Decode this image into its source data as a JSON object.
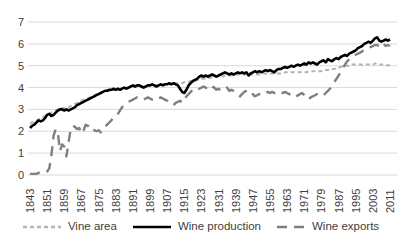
{
  "chart_data": {
    "type": "line",
    "title": "",
    "xlabel": "",
    "ylabel": "",
    "grid": "horizontal",
    "legend_position": "bottom",
    "x_axis": {
      "start_year": 1843,
      "end_year": 2011,
      "step": 1,
      "tick_labels": [
        "1843",
        "1851",
        "1859",
        "1867",
        "1875",
        "1883",
        "1891",
        "1899",
        "1907",
        "1915",
        "1923",
        "1931",
        "1939",
        "1947",
        "1955",
        "1963",
        "1971",
        "1979",
        "1987",
        "1995",
        "2003",
        "2011"
      ]
    },
    "y_axis": {
      "min": 0,
      "max": 7,
      "tick_step": 1,
      "tick_labels": [
        "0",
        "1",
        "2",
        "3",
        "4",
        "5",
        "6",
        "7"
      ]
    },
    "colors": {
      "gridline": "#d9d9d9",
      "tick_text": "#404040"
    },
    "series": [
      {
        "name": "Vine area",
        "color": "#b3b3b3",
        "dash": "4 3",
        "width": 2,
        "values": [
          2.35,
          2.4,
          2.45,
          2.5,
          2.55,
          2.6,
          2.65,
          2.7,
          2.75,
          2.8,
          2.85,
          2.9,
          2.95,
          3.0,
          3.0,
          3.05,
          3.05,
          3.1,
          3.1,
          3.15,
          3.2,
          3.25,
          3.3,
          3.35,
          3.4,
          3.45,
          3.5,
          3.5,
          3.55,
          3.6,
          3.65,
          3.7,
          3.7,
          3.75,
          3.8,
          3.8,
          3.85,
          3.85,
          3.9,
          3.9,
          3.9,
          3.95,
          3.95,
          3.95,
          4.0,
          4.0,
          4.0,
          4.05,
          4.05,
          4.05,
          4.05,
          4.05,
          4.05,
          4.05,
          4.1,
          4.1,
          4.1,
          4.1,
          4.1,
          4.1,
          4.1,
          4.15,
          4.15,
          4.15,
          4.15,
          4.15,
          4.15,
          4.2,
          4.2,
          4.2,
          4.2,
          4.2,
          4.25,
          4.25,
          4.25,
          4.3,
          4.3,
          4.3,
          4.35,
          4.35,
          4.4,
          4.4,
          4.4,
          4.45,
          4.45,
          4.45,
          4.5,
          4.5,
          4.5,
          4.5,
          4.5,
          4.55,
          4.55,
          4.55,
          4.55,
          4.55,
          4.6,
          4.6,
          4.6,
          4.6,
          4.6,
          4.6,
          4.6,
          4.6,
          4.6,
          4.6,
          4.6,
          4.6,
          4.6,
          4.65,
          4.65,
          4.65,
          4.65,
          4.65,
          4.65,
          4.65,
          4.65,
          4.65,
          4.65,
          4.7,
          4.7,
          4.7,
          4.7,
          4.7,
          4.7,
          4.7,
          4.7,
          4.7,
          4.7,
          4.7,
          4.75,
          4.75,
          4.75,
          4.75,
          4.75,
          4.75,
          4.75,
          4.8,
          4.8,
          4.8,
          4.85,
          4.85,
          4.85,
          4.9,
          4.9,
          4.95,
          4.95,
          5.0,
          5.0,
          5.0,
          5.05,
          5.05,
          5.05,
          5.05,
          5.05,
          5.05,
          5.05,
          5.05,
          5.05,
          5.05,
          5.05,
          5.1,
          5.1,
          5.05,
          5.05,
          5.05,
          5.05,
          5.0,
          5.05
        ]
      },
      {
        "name": "Wine production",
        "color": "#000000",
        "dash": "",
        "width": 2.6,
        "values": [
          2.15,
          2.25,
          2.3,
          2.4,
          2.5,
          2.45,
          2.5,
          2.6,
          2.75,
          2.8,
          2.7,
          2.75,
          2.85,
          2.95,
          3.0,
          3.0,
          2.95,
          3.0,
          2.95,
          3.0,
          3.05,
          3.1,
          3.2,
          3.25,
          3.3,
          3.35,
          3.4,
          3.45,
          3.5,
          3.55,
          3.6,
          3.65,
          3.7,
          3.75,
          3.8,
          3.85,
          3.85,
          3.9,
          3.9,
          3.95,
          3.9,
          3.95,
          3.9,
          3.95,
          4.0,
          3.95,
          4.0,
          4.05,
          4.1,
          4.05,
          4.1,
          4.1,
          4.05,
          4.0,
          4.05,
          4.1,
          4.1,
          4.15,
          4.1,
          4.05,
          4.1,
          4.15,
          4.1,
          4.15,
          4.15,
          4.2,
          4.15,
          4.2,
          4.15,
          4.1,
          3.95,
          3.8,
          3.75,
          3.9,
          4.1,
          4.2,
          4.3,
          4.35,
          4.4,
          4.5,
          4.55,
          4.5,
          4.55,
          4.5,
          4.55,
          4.6,
          4.55,
          4.5,
          4.55,
          4.6,
          4.65,
          4.7,
          4.65,
          4.6,
          4.65,
          4.6,
          4.65,
          4.7,
          4.65,
          4.7,
          4.65,
          4.7,
          4.55,
          4.65,
          4.7,
          4.75,
          4.7,
          4.75,
          4.7,
          4.75,
          4.8,
          4.75,
          4.8,
          4.75,
          4.7,
          4.8,
          4.85,
          4.85,
          4.9,
          4.95,
          4.9,
          4.95,
          5.0,
          4.95,
          5.0,
          5.05,
          5.0,
          5.05,
          5.1,
          5.05,
          5.15,
          5.1,
          5.15,
          5.1,
          5.05,
          5.15,
          5.2,
          5.25,
          5.15,
          5.3,
          5.25,
          5.2,
          5.3,
          5.35,
          5.3,
          5.4,
          5.45,
          5.5,
          5.45,
          5.55,
          5.6,
          5.65,
          5.7,
          5.8,
          5.85,
          5.9,
          6.0,
          6.05,
          6.1,
          6.05,
          6.15,
          6.25,
          6.3,
          6.15,
          6.1,
          6.15,
          6.2,
          6.15,
          6.2
        ]
      },
      {
        "name": "Wine exports",
        "color": "#7f7f7f",
        "dash": "10 7",
        "width": 2.4,
        "values": [
          0.05,
          0.05,
          0.05,
          0.05,
          0.1,
          0.1,
          0.1,
          0.1,
          0.15,
          0.3,
          0.9,
          1.8,
          2.1,
          1.9,
          1.1,
          1.4,
          1.3,
          0.85,
          1.5,
          2.1,
          2.25,
          2.2,
          2.1,
          2.15,
          1.9,
          2.05,
          2.3,
          2.25,
          2.15,
          2.2,
          2.05,
          2.0,
          2.05,
          1.95,
          2.05,
          2.2,
          2.3,
          2.4,
          2.5,
          2.65,
          2.7,
          2.8,
          2.95,
          3.1,
          3.2,
          3.3,
          3.35,
          3.4,
          3.45,
          3.5,
          3.55,
          3.5,
          3.5,
          3.45,
          3.5,
          3.55,
          3.5,
          3.45,
          3.5,
          3.45,
          3.5,
          3.55,
          3.5,
          3.45,
          3.4,
          3.3,
          3.25,
          3.2,
          3.3,
          3.35,
          3.4,
          3.3,
          3.45,
          3.6,
          3.7,
          3.8,
          3.9,
          3.95,
          3.9,
          3.95,
          4.0,
          4.05,
          4.0,
          3.9,
          3.95,
          4.05,
          4.0,
          3.9,
          3.95,
          3.85,
          3.9,
          3.95,
          4.0,
          3.85,
          3.9,
          3.85,
          3.8,
          3.7,
          3.6,
          3.7,
          3.8,
          3.85,
          3.9,
          3.8,
          3.7,
          3.6,
          3.65,
          3.7,
          3.75,
          3.8,
          3.75,
          3.8,
          3.75,
          3.8,
          3.75,
          3.8,
          3.75,
          3.8,
          3.75,
          3.8,
          3.75,
          3.7,
          3.65,
          3.6,
          3.55,
          3.65,
          3.7,
          3.75,
          3.65,
          3.55,
          3.45,
          3.55,
          3.6,
          3.65,
          3.7,
          3.65,
          3.6,
          3.65,
          3.75,
          3.85,
          3.95,
          4.1,
          4.25,
          4.4,
          4.55,
          4.7,
          4.9,
          5.05,
          5.2,
          5.3,
          5.4,
          5.45,
          5.5,
          5.55,
          5.6,
          5.65,
          5.75,
          5.8,
          5.85,
          5.85,
          5.9,
          5.95,
          5.95,
          5.9,
          5.85,
          6.0,
          5.9,
          5.95,
          5.9
        ]
      }
    ]
  }
}
